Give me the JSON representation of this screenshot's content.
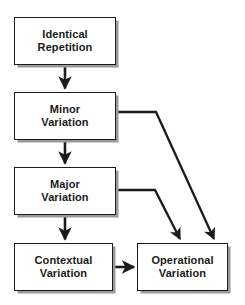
{
  "diagram": {
    "type": "flowchart",
    "canvas": {
      "width": 245,
      "height": 305,
      "background": "#ffffff"
    },
    "style": {
      "node_fill": "#ffffff",
      "node_border": "#1b1b1b",
      "node_shadow": "#9a9a9a",
      "text_color": "#1a1a1a",
      "edge_color": "#1b1b1b"
    },
    "nodes": [
      {
        "id": "identical-repetition",
        "label": "Identical\nRepetition",
        "line1": "Identical",
        "line2": "Repetition",
        "x": 14,
        "y": 17,
        "width": 102,
        "height": 48
      },
      {
        "id": "minor-variation",
        "label": "Minor\nVariation",
        "line1": "Minor",
        "line2": "Variation",
        "x": 14,
        "y": 92,
        "width": 102,
        "height": 48
      },
      {
        "id": "major-variation",
        "label": "Major\nVariation",
        "line1": "Major",
        "line2": "Variation",
        "x": 14,
        "y": 167,
        "width": 102,
        "height": 48
      },
      {
        "id": "contextual-variation",
        "label": "Contextual\nVariation",
        "line1": "Contextual",
        "line2": "Variation",
        "x": 14,
        "y": 243,
        "width": 99,
        "height": 48
      },
      {
        "id": "operational-variation",
        "label": "Operational\nVariation",
        "line1": "Operational",
        "line2": "Variation",
        "x": 137,
        "y": 243,
        "width": 91,
        "height": 48
      }
    ],
    "edges": [
      {
        "id": "edge-identical-to-minor",
        "from": "identical-repetition",
        "to": "minor-variation",
        "kind": "vertical"
      },
      {
        "id": "edge-minor-to-major",
        "from": "minor-variation",
        "to": "major-variation",
        "kind": "vertical"
      },
      {
        "id": "edge-major-to-contextual",
        "from": "major-variation",
        "to": "contextual-variation",
        "kind": "vertical"
      },
      {
        "id": "edge-contextual-to-operational",
        "from": "contextual-variation",
        "to": "operational-variation",
        "kind": "horizontal"
      },
      {
        "id": "edge-minor-to-operational",
        "from": "minor-variation",
        "to": "operational-variation",
        "kind": "elbow-diagonal"
      },
      {
        "id": "edge-major-to-operational",
        "from": "major-variation",
        "to": "operational-variation",
        "kind": "elbow-diagonal"
      }
    ]
  }
}
